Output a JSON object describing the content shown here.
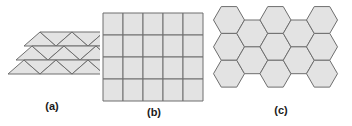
{
  "figure": {
    "background_color": "#ffffff",
    "tile_fill_color": "#e3e3e3",
    "tile_stroke_color": "#6e6e6e",
    "caption_color": "#1a1a1a",
    "panels": [
      {
        "id": "a",
        "caption": "(a)",
        "tiling_name": "triangular-tiling",
        "shape": "triangle",
        "description": "Regular triangular tiling arranged as a parallelogram",
        "rows": 3,
        "columns": 4,
        "tile_count": 24
      },
      {
        "id": "b",
        "caption": "(b)",
        "tiling_name": "square-tiling",
        "shape": "square",
        "description": "Regular square grid tiling",
        "rows": 4,
        "columns": 5,
        "tile_count": 20
      },
      {
        "id": "c",
        "caption": "(c)",
        "tiling_name": "hexagonal-tiling",
        "shape": "hexagon",
        "description": "Regular hexagonal honeycomb tiling",
        "rows": 3,
        "columns": 5,
        "tile_count": 17
      }
    ]
  }
}
